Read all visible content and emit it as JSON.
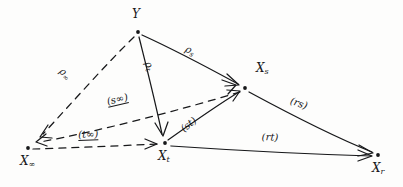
{
  "diagram": {
    "ink_color": "#17181a",
    "background_color": "#fdfdfc",
    "nodes": [
      {
        "id": "Y",
        "label": "Y",
        "sub": "",
        "x": 138,
        "y": 32,
        "label_x": 132,
        "label_y": 8
      },
      {
        "id": "Xs",
        "label": "X",
        "sub": "s",
        "x": 245,
        "y": 88,
        "label_x": 256,
        "label_y": 62
      },
      {
        "id": "Xt",
        "label": "X",
        "sub": "t",
        "x": 165,
        "y": 143,
        "label_x": 158,
        "label_y": 150
      },
      {
        "id": "Xr",
        "label": "X",
        "sub": "r",
        "x": 378,
        "y": 155,
        "label_x": 372,
        "label_y": 162
      },
      {
        "id": "Xinf",
        "label": "X",
        "sub": "∞",
        "x": 28,
        "y": 148,
        "label_x": 20,
        "label_y": 155
      }
    ],
    "edges": [
      {
        "id": "rho-s",
        "from": "Y",
        "to": "Xs",
        "style": "solid",
        "arrow": true,
        "label": "ρ",
        "sub": "s",
        "underline": false,
        "label_x": 188,
        "label_y": 44
      },
      {
        "id": "rho-t",
        "from": "Y",
        "to": "Xt",
        "style": "solid",
        "arrow": true,
        "label": "ρ",
        "sub": "t",
        "underline": false,
        "label_x": 152,
        "label_y": 60
      },
      {
        "id": "rho-inf",
        "from": "Y",
        "to": "Xinf",
        "style": "dashed",
        "arrow": true,
        "label": "ρ",
        "sub": "∞",
        "underline": false,
        "label_x": 64,
        "label_y": 66
      },
      {
        "id": "s-inf",
        "from": "Xs",
        "to": "Xinf",
        "style": "dashed",
        "arrow": true,
        "label": "(s∞)",
        "sub": "",
        "underline": true,
        "label_x": 106,
        "label_y": 97
      },
      {
        "id": "t-inf",
        "from": "Xinf",
        "to": "Xt",
        "style": "dashed",
        "arrow": true,
        "label": "(t∞)",
        "sub": "",
        "underline": true,
        "label_x": 78,
        "label_y": 130
      },
      {
        "id": "s-t",
        "from": "Xt",
        "to": "Xs",
        "style": "solid",
        "arrow": true,
        "label": "(st)",
        "sub": "",
        "underline": false,
        "label_x": 179,
        "label_y": 126
      },
      {
        "id": "r-s",
        "from": "Xs",
        "to": "Xr",
        "style": "solid",
        "arrow": true,
        "label": "(rs)",
        "sub": "",
        "underline": false,
        "label_x": 292,
        "label_y": 96
      },
      {
        "id": "r-t",
        "from": "Xt",
        "to": "Xr",
        "style": "solid",
        "arrow": true,
        "label": "(rt)",
        "sub": "",
        "underline": false,
        "label_x": 262,
        "label_y": 132
      }
    ]
  }
}
